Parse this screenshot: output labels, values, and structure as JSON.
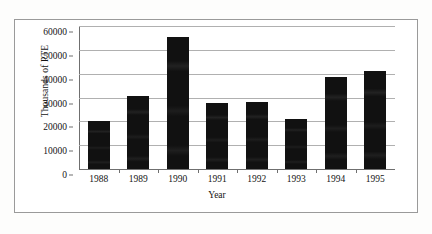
{
  "chart_data": {
    "type": "bar",
    "title": "",
    "xlabel": "Year",
    "ylabel": "Thousands of PTE",
    "categories": [
      "1988",
      "1989",
      "1990",
      "1991",
      "1992",
      "1993",
      "1994",
      "1995"
    ],
    "values": [
      20000,
      30500,
      55500,
      27500,
      28000,
      21000,
      38500,
      41000
    ],
    "ylim": [
      0,
      60000
    ],
    "yticks": [
      0,
      10000,
      20000,
      30000,
      40000,
      50000,
      60000
    ],
    "ytick_labels": [
      "0",
      "10000",
      "20000",
      "30000",
      "40000",
      "50000",
      "60000"
    ],
    "grid": true,
    "legend": false,
    "legend_position": "none",
    "bar_color": "#111111",
    "gridline_color": "#b0b0b0",
    "axis_color": "#6f6f6f",
    "frame_color": "#9a9a9a",
    "background_color": "#ffffff"
  }
}
